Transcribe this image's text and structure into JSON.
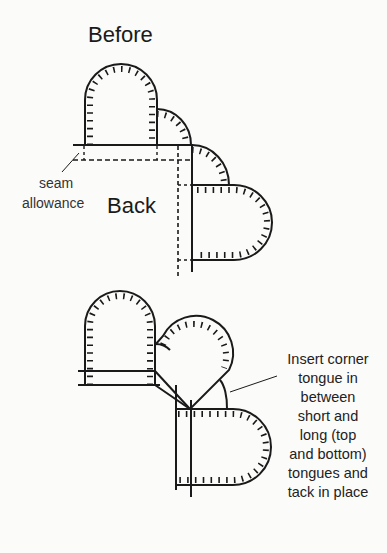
{
  "labels": {
    "before": "Before",
    "back": "Back",
    "seam": "seam",
    "allowance": "allowance"
  },
  "note": {
    "lines": [
      "Insert corner",
      "tongue in",
      "between",
      "short and",
      "long (top",
      "and bottom)",
      "tongues and",
      "tack in place"
    ]
  },
  "colors": {
    "ink": "#1a1a1a",
    "background": "#fbfbfa"
  }
}
